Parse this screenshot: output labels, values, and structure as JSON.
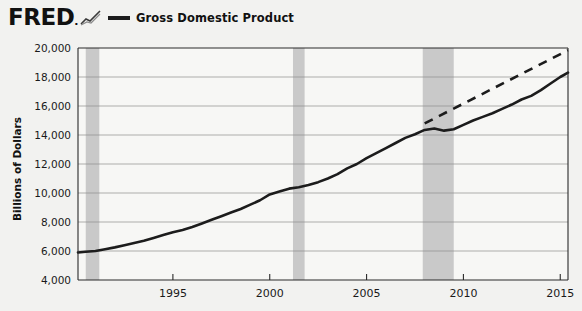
{
  "header": {
    "brand": "FRED",
    "brand_mark": ".",
    "logo_icon": "fred-chart-icon",
    "legend_label": "Gross Domestic Product",
    "legend_color": "#1c1c1c"
  },
  "axes": {
    "ylabel": "Billions of Dollars",
    "yticks": [
      "20,000",
      "18,000",
      "16,000",
      "14,000",
      "12,000",
      "10,000",
      "8,000",
      "6,000",
      "4,000"
    ],
    "xticks": [
      "1995",
      "2000",
      "2005",
      "2010",
      "2015"
    ]
  },
  "chart_data": {
    "type": "line",
    "title": "Gross Domestic Product",
    "xlabel": "",
    "ylabel": "Billions of Dollars",
    "xlim": [
      1990.1,
      1015.4
    ],
    "ylim": [
      4000,
      20000
    ],
    "ytick_values": [
      4000,
      6000,
      8000,
      10000,
      12000,
      14000,
      16000,
      18000,
      20000
    ],
    "xtick_values": [
      1995,
      2000,
      2005,
      2010,
      2015
    ],
    "grid": true,
    "legend_position": "top",
    "series": [
      {
        "name": "Gross Domestic Product",
        "style": "solid",
        "color": "#1c1c1c",
        "x": [
          1990.1,
          1990.5,
          1991.0,
          1991.5,
          1992.0,
          1992.5,
          1993.0,
          1993.5,
          1994.0,
          1994.5,
          1995.0,
          1995.5,
          1996.0,
          1996.5,
          1997.0,
          1997.5,
          1998.0,
          1998.5,
          1999.0,
          1999.5,
          2000.0,
          2000.5,
          2001.0,
          2001.5,
          2002.0,
          2002.5,
          2003.0,
          2003.5,
          2004.0,
          2004.5,
          2005.0,
          2005.5,
          2006.0,
          2006.5,
          2007.0,
          2007.5,
          2008.0,
          2008.5,
          2009.0,
          2009.5,
          2010.0,
          2010.5,
          2011.0,
          2011.5,
          2012.0,
          2012.5,
          2013.0,
          2013.5,
          2014.0,
          2014.5,
          2015.0,
          2015.4
        ],
        "y": [
          5900,
          5950,
          6000,
          6120,
          6250,
          6400,
          6550,
          6700,
          6900,
          7100,
          7300,
          7450,
          7650,
          7900,
          8150,
          8400,
          8650,
          8900,
          9200,
          9500,
          9900,
          10100,
          10300,
          10400,
          10550,
          10750,
          11000,
          11300,
          11700,
          12000,
          12400,
          12750,
          13100,
          13450,
          13800,
          14050,
          14350,
          14450,
          14300,
          14400,
          14700,
          15000,
          15250,
          15500,
          15800,
          16100,
          16450,
          16700,
          17100,
          17550,
          18000,
          18300
        ]
      },
      {
        "name": "Trend extension",
        "style": "dashed",
        "color": "#1c1c1c",
        "x": [
          2008.0,
          2015.4
        ],
        "y": [
          14800,
          19850
        ]
      }
    ],
    "recessions": [
      {
        "start": 1990.5,
        "end": 1991.2,
        "color": "#c9c9c9"
      },
      {
        "start": 2001.2,
        "end": 2001.8,
        "color": "#c9c9c9"
      },
      {
        "start": 2007.9,
        "end": 2009.5,
        "color": "#c9c9c9"
      }
    ]
  }
}
